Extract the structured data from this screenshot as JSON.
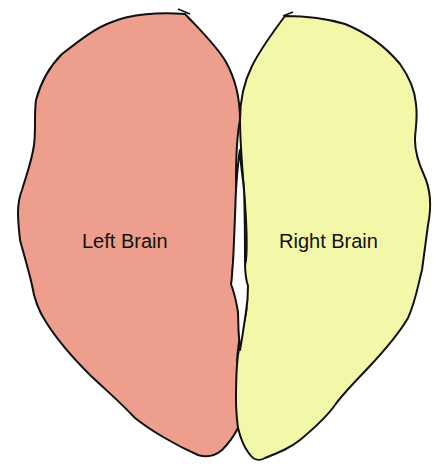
{
  "diagram": {
    "type": "brain-hemispheres",
    "hemispheres": [
      {
        "id": "left",
        "label": "Left Brain",
        "fill": "#ed9e8c"
      },
      {
        "id": "right",
        "label": "Right Brain",
        "fill": "#f3f8a8"
      }
    ],
    "outline_color": "#111111"
  }
}
